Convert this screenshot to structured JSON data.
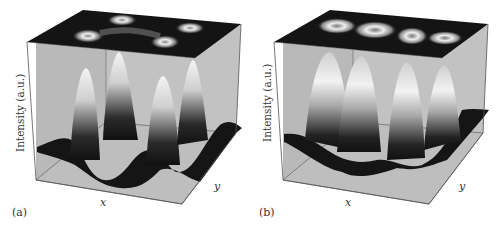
{
  "figure": {
    "panels": [
      {
        "id": "a",
        "label": "(a)",
        "ylabel": "Intensity (a.u.)",
        "xlabel": "x",
        "zlabel": "y",
        "top_projection": "four ring-shaped intensity spots in a 2x2 arrangement connected by a faint bridge",
        "surface": "four sharp peaks on a wavy dark base"
      },
      {
        "id": "b",
        "label": "(b)",
        "ylabel": "Intensity (a.u.)",
        "xlabel": "x",
        "zlabel": "y",
        "top_projection": "four elongated teardrop/ring spots in a row",
        "surface": "four elongated ridge-shaped lobes on a wavy dark base"
      }
    ]
  },
  "colors": {
    "wall": "#b8b8b8",
    "floor": "#bdbdbd",
    "top": "#141414",
    "edge": "#555555",
    "surface_dark": "#111111",
    "surface_light": "#f2f2f2"
  }
}
